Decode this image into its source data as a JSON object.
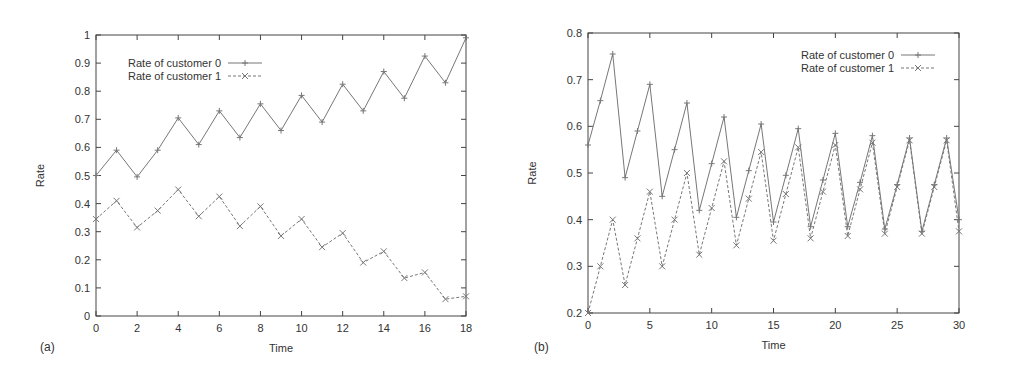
{
  "chart_data": [
    {
      "type": "line",
      "panel_label": "(a)",
      "title": "",
      "xlabel": "Time",
      "ylabel": "Rate",
      "xlim": [
        0,
        18
      ],
      "ylim": [
        0,
        1
      ],
      "xticks": [
        0,
        2,
        4,
        6,
        8,
        10,
        12,
        14,
        16,
        18
      ],
      "yticks": [
        0,
        0.1,
        0.2,
        0.3,
        0.4,
        0.5,
        0.6,
        0.7,
        0.8,
        0.9,
        1
      ],
      "ytick_labels": [
        "0",
        "0.1",
        "0.2",
        "0.3",
        "0.4",
        "0.5",
        "0.6",
        "0.7",
        "0.8",
        "0.9",
        "1"
      ],
      "grid": false,
      "legend_position": "upper left",
      "x": [
        0,
        1,
        2,
        3,
        4,
        5,
        6,
        7,
        8,
        9,
        10,
        11,
        12,
        13,
        14,
        15,
        16,
        17,
        18
      ],
      "series": [
        {
          "name": "Rate of customer 0",
          "style": "solid",
          "marker": "+",
          "values": [
            0.5,
            0.59,
            0.495,
            0.59,
            0.705,
            0.61,
            0.73,
            0.635,
            0.755,
            0.66,
            0.785,
            0.69,
            0.825,
            0.73,
            0.87,
            0.775,
            0.925,
            0.83,
            0.99
          ]
        },
        {
          "name": "Rate of customer 1",
          "style": "dashed",
          "marker": "x",
          "values": [
            0.345,
            0.41,
            0.315,
            0.375,
            0.45,
            0.355,
            0.425,
            0.32,
            0.39,
            0.285,
            0.345,
            0.245,
            0.295,
            0.19,
            0.23,
            0.135,
            0.155,
            0.06,
            0.07
          ]
        }
      ]
    },
    {
      "type": "line",
      "panel_label": "(b)",
      "title": "",
      "xlabel": "Time",
      "ylabel": "Rate",
      "xlim": [
        0,
        30
      ],
      "ylim": [
        0.2,
        0.8
      ],
      "xticks": [
        0,
        5,
        10,
        15,
        20,
        25,
        30
      ],
      "yticks": [
        0.2,
        0.3,
        0.4,
        0.5,
        0.6,
        0.7,
        0.8
      ],
      "ytick_labels": [
        "0.2",
        "0.3",
        "0.4",
        "0.5",
        "0.6",
        "0.7",
        "0.8"
      ],
      "grid": false,
      "legend_position": "upper right",
      "x": [
        0,
        1,
        2,
        3,
        4,
        5,
        6,
        7,
        8,
        9,
        10,
        11,
        12,
        13,
        14,
        15,
        16,
        17,
        18,
        19,
        20,
        21,
        22,
        23,
        24,
        25,
        26,
        27,
        28,
        29,
        30
      ],
      "series": [
        {
          "name": "Rate of customer 0",
          "style": "solid",
          "marker": "+",
          "values": [
            0.56,
            0.655,
            0.755,
            0.49,
            0.59,
            0.69,
            0.45,
            0.55,
            0.65,
            0.42,
            0.52,
            0.62,
            0.405,
            0.505,
            0.605,
            0.395,
            0.495,
            0.595,
            0.385,
            0.485,
            0.585,
            0.385,
            0.48,
            0.58,
            0.38,
            0.475,
            0.575,
            0.375,
            0.475,
            0.575,
            0.4
          ]
        },
        {
          "name": "Rate of customer 1",
          "style": "dashed",
          "marker": "x",
          "values": [
            0.2,
            0.3,
            0.4,
            0.26,
            0.36,
            0.46,
            0.3,
            0.4,
            0.5,
            0.325,
            0.425,
            0.525,
            0.345,
            0.445,
            0.545,
            0.355,
            0.455,
            0.555,
            0.36,
            0.46,
            0.56,
            0.365,
            0.465,
            0.565,
            0.37,
            0.47,
            0.57,
            0.37,
            0.47,
            0.57,
            0.375
          ]
        }
      ]
    }
  ],
  "colors": {
    "axis": "#444444",
    "line": "#777777",
    "text": "#333333"
  }
}
